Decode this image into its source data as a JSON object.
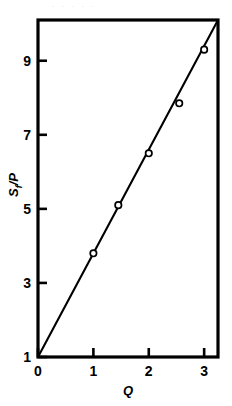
{
  "figure": {
    "background_color": "#ffffff",
    "ink_color": "#000000",
    "top_partial_text": ". . . . ."
  },
  "chart_data": {
    "type": "scatter",
    "title": "",
    "subtitle": "",
    "xlabel": "Q",
    "ylabel": "Sf/P",
    "ylabel_base": "S",
    "ylabel_subscript": "f",
    "ylabel_tail": "/P",
    "xlim": [
      0,
      3.25
    ],
    "ylim": [
      1,
      10.1
    ],
    "xticks": [
      0,
      1,
      2,
      3
    ],
    "xtick_labels": [
      "0",
      "1",
      "2",
      "3"
    ],
    "yticks": [
      1,
      3,
      5,
      7,
      9
    ],
    "ytick_labels": [
      "1",
      "3",
      "5",
      "7",
      "9"
    ],
    "grid": false,
    "legend": null,
    "marker_style": "open-circle",
    "x": [
      1.0,
      1.45,
      2.0,
      2.55,
      3.0
    ],
    "y": [
      3.8,
      5.1,
      6.5,
      7.85,
      9.3
    ],
    "series": [
      {
        "name": "measured",
        "points": [
          {
            "x": 1.0,
            "y": 3.8
          },
          {
            "x": 1.45,
            "y": 5.1
          },
          {
            "x": 2.0,
            "y": 6.5
          },
          {
            "x": 2.55,
            "y": 7.85
          },
          {
            "x": 3.0,
            "y": 9.3
          }
        ]
      }
    ],
    "fit_line": {
      "name": "linear fit",
      "intercept": 1.0,
      "slope": 2.8,
      "x_start": 0.0,
      "y_start": 1.0,
      "x_end": 3.25,
      "y_end": 10.1
    },
    "frame": {
      "left": 38,
      "right": 218,
      "top": 20,
      "bottom": 357,
      "line_width": 3
    }
  }
}
